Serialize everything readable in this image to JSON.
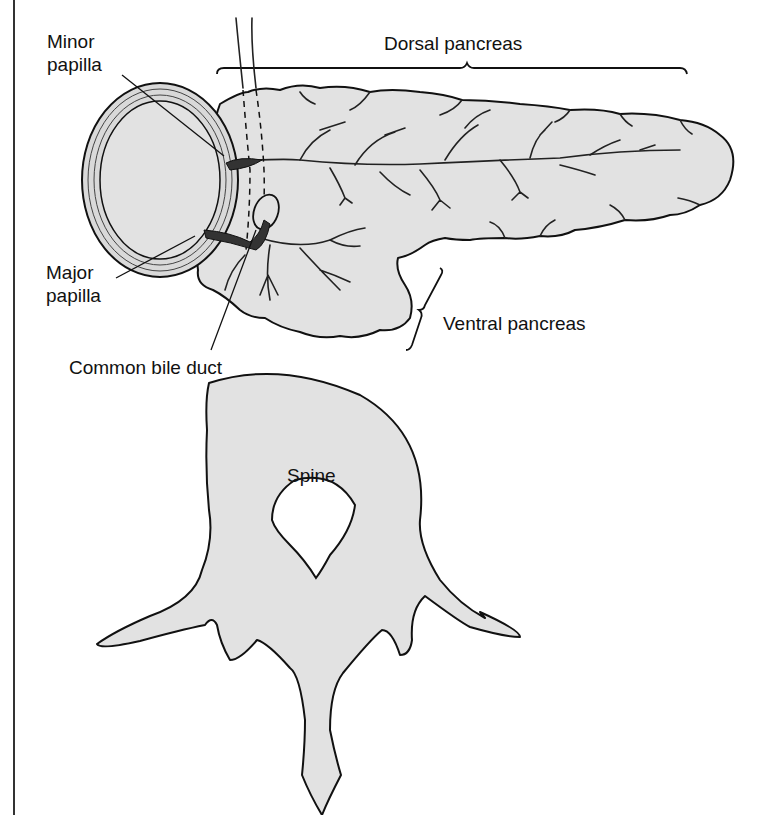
{
  "figure": {
    "fill_color": "#e2e2e2",
    "stroke_color": "#111111",
    "background": "#ffffff"
  },
  "labels": {
    "minor_papilla": [
      "Minor",
      "papilla"
    ],
    "major_papilla": [
      "Major",
      "papilla"
    ],
    "dorsal_pancreas": "Dorsal pancreas",
    "ventral_pancreas": "Ventral pancreas",
    "common_bile_duct": "Common bile duct",
    "spine": "Spine"
  }
}
